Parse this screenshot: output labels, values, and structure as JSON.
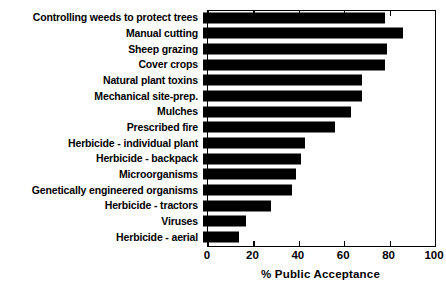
{
  "chart_data": {
    "type": "bar",
    "orientation": "horizontal",
    "title": "",
    "xlabel": "% Public Acceptance",
    "ylabel": "",
    "xlim": [
      0,
      100
    ],
    "xticks": [
      0,
      20,
      40,
      60,
      80,
      100
    ],
    "grid": false,
    "legend": null,
    "bar_color": "#000000",
    "categories": [
      "Controlling weeds to protect trees",
      "Manual cutting",
      "Sheep grazing",
      "Cover crops",
      "Natural plant toxins",
      "Mechanical site-prep.",
      "Mulches",
      "Prescribed fire",
      "Herbicide - individual plant",
      "Herbicide - backpack",
      "Microorganisms",
      "Genetically engineered organisms",
      "Herbicide - tractors",
      "Viruses",
      "Herbicide - aerial"
    ],
    "values": [
      80,
      88,
      81,
      80,
      70,
      70,
      65,
      58,
      45,
      43,
      41,
      39,
      30,
      19,
      16
    ]
  }
}
